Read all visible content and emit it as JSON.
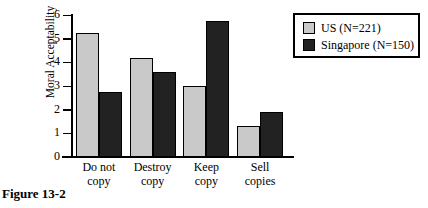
{
  "caption": "Figure 13-2",
  "chart_data": {
    "type": "bar",
    "title": "",
    "xlabel": "",
    "ylabel": "Moral Acceptability",
    "categories": [
      "Do not copy",
      "Destroy copy",
      "Keep copy",
      "Sell copies"
    ],
    "category_lines": [
      [
        "Do not",
        "copy"
      ],
      [
        "Destroy",
        "copy"
      ],
      [
        "Keep",
        "copy"
      ],
      [
        "Sell",
        "copies"
      ]
    ],
    "series": [
      {
        "name": "US (N=221)",
        "color": "#c9c9c9",
        "values": [
          5.25,
          4.2,
          3.0,
          1.3
        ]
      },
      {
        "name": "Singapore (N=150)",
        "color": "#222222",
        "values": [
          2.75,
          3.6,
          5.75,
          1.9
        ]
      }
    ],
    "ylim": [
      0,
      6
    ],
    "yticks": [
      0,
      1,
      2,
      3,
      4,
      5,
      6
    ],
    "ytick_labels": [
      "0",
      "1",
      "2",
      "3",
      "4",
      "5",
      "6"
    ],
    "grid": false,
    "legend_position": "top-right"
  }
}
